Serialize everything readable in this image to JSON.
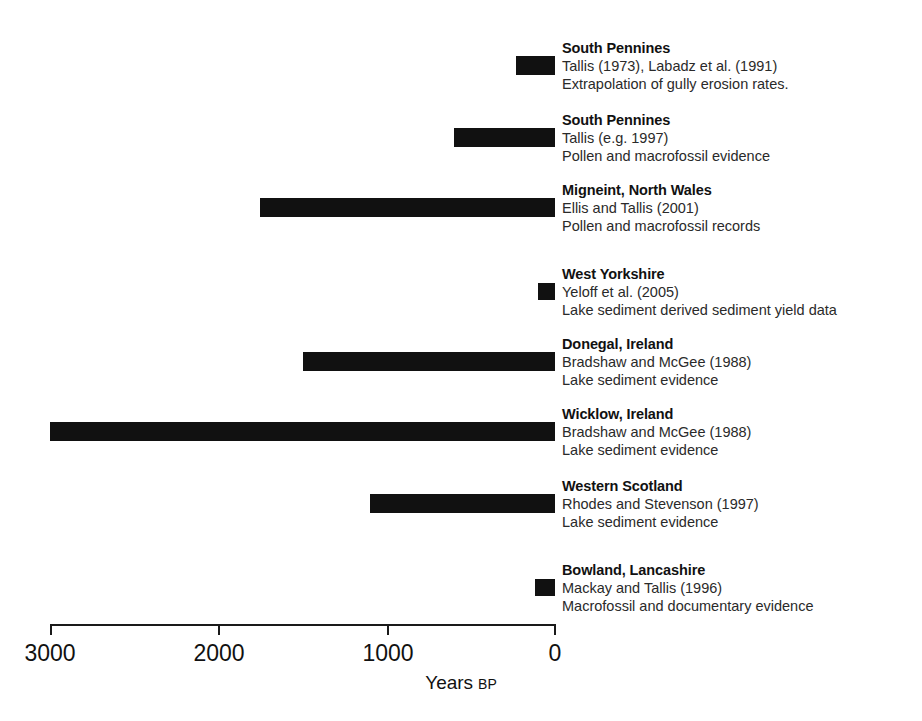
{
  "chart_data": {
    "type": "bar",
    "title": "",
    "xlabel": "Years BP",
    "ylabel": "",
    "xlim": [
      3000,
      0
    ],
    "x_ticks": [
      3000,
      2000,
      1000,
      0
    ],
    "x_tick_labels": [
      "3000",
      "2000",
      "1000",
      "0"
    ],
    "grid": false,
    "legend": "none",
    "orientation": "horizontal-ranges",
    "axis_note": "x-axis reversed: 3000 years BP at left, 0 (present) at right",
    "bar_color": "#111111",
    "categories": [
      "South Pennines",
      "South Pennines",
      "Migneint, North Wales",
      "West Yorkshire",
      "Donegal, Ireland",
      "Wicklow, Ireland",
      "Western Scotland",
      "Bowland, Lancashire"
    ],
    "ranges_years_bp": [
      [
        230,
        0
      ],
      [
        600,
        0
      ],
      [
        1750,
        0
      ],
      [
        100,
        0
      ],
      [
        1500,
        0
      ],
      [
        3000,
        0
      ],
      [
        1100,
        0
      ],
      [
        120,
        0
      ]
    ],
    "entries": [
      {
        "site": "South Pennines",
        "reference": "Tallis (1973), Labadz et al. (1991)",
        "evidence": "Extrapolation of gully erosion rates.",
        "start_bp": 230,
        "end_bp": 0
      },
      {
        "site": "South Pennines",
        "reference": "Tallis (e.g. 1997)",
        "evidence": "Pollen and macrofossil evidence",
        "start_bp": 600,
        "end_bp": 0
      },
      {
        "site": "Migneint, North Wales",
        "reference": "Ellis and Tallis (2001)",
        "evidence": "Pollen and macrofossil records",
        "start_bp": 1750,
        "end_bp": 0
      },
      {
        "site": "West Yorkshire",
        "reference": "Yeloff et al. (2005)",
        "evidence": "Lake sediment derived sediment yield data",
        "start_bp": 100,
        "end_bp": 0
      },
      {
        "site": "Donegal, Ireland",
        "reference": "Bradshaw and McGee (1988)",
        "evidence": "Lake sediment evidence",
        "start_bp": 1500,
        "end_bp": 0
      },
      {
        "site": "Wicklow, Ireland",
        "reference": "Bradshaw and McGee (1988)",
        "evidence": "Lake sediment evidence",
        "start_bp": 3000,
        "end_bp": 0
      },
      {
        "site": "Western Scotland",
        "reference": "Rhodes and Stevenson (1997)",
        "evidence": "Lake sediment evidence",
        "start_bp": 1100,
        "end_bp": 0
      },
      {
        "site": "Bowland, Lancashire",
        "reference": "Mackay and Tallis (1996)",
        "evidence": "Macrofossil and documentary evidence",
        "start_bp": 120,
        "end_bp": 0
      }
    ]
  },
  "axis": {
    "title_main": "Years",
    "title_sub": "BP",
    "tick_labels": [
      "3000",
      "2000",
      "1000",
      "0"
    ]
  },
  "entries": [
    {
      "site": "South Pennines",
      "reference": "Tallis (1973), Labadz et al. (1991)",
      "evidence": "Extrapolation of gully erosion rates."
    },
    {
      "site": "South Pennines",
      "reference": "Tallis (e.g. 1997)",
      "evidence": "Pollen and macrofossil evidence"
    },
    {
      "site": "Migneint, North Wales",
      "reference": "Ellis and Tallis (2001)",
      "evidence": "Pollen and macrofossil records"
    },
    {
      "site": "West Yorkshire",
      "reference": "Yeloff et al. (2005)",
      "evidence": "Lake sediment derived sediment yield data"
    },
    {
      "site": "Donegal, Ireland",
      "reference": "Bradshaw and McGee (1988)",
      "evidence": "Lake sediment evidence"
    },
    {
      "site": "Wicklow, Ireland",
      "reference": "Bradshaw and McGee (1988)",
      "evidence": "Lake sediment evidence"
    },
    {
      "site": "Western Scotland",
      "reference": "Rhodes and Stevenson (1997)",
      "evidence": "Lake sediment evidence"
    },
    {
      "site": "Bowland, Lancashire",
      "reference": "Mackay and Tallis (1996)",
      "evidence": "Macrofossil and documentary evidence"
    }
  ]
}
